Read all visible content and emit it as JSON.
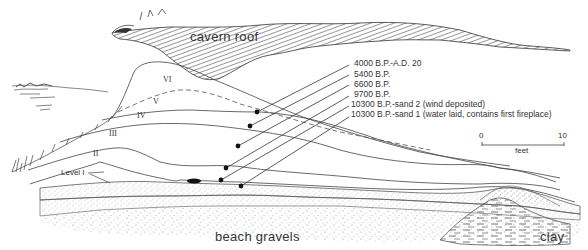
{
  "figure": {
    "labels": {
      "cavern_roof": "cavern roof",
      "beach_gravels": "beach gravels",
      "clay": "clay",
      "level_prefix": "Level I"
    },
    "levels": [
      "VI",
      "V",
      "IV",
      "III",
      "II"
    ],
    "dates": [
      "4000 B.P.-A.D. 20",
      "5400 B.P.",
      "6600 B.P.",
      "9700 B.P.",
      "10300 B.P.-sand 2 (wind deposited)",
      "10300 B.P.-sand 1 (water laid, contains first fireplace)"
    ],
    "scale": {
      "start": "0",
      "end": "10",
      "unit": "feet"
    },
    "colors": {
      "ink": "#2a2a2a",
      "background": "#ffffff",
      "stipple": "#8a8a8a"
    }
  }
}
